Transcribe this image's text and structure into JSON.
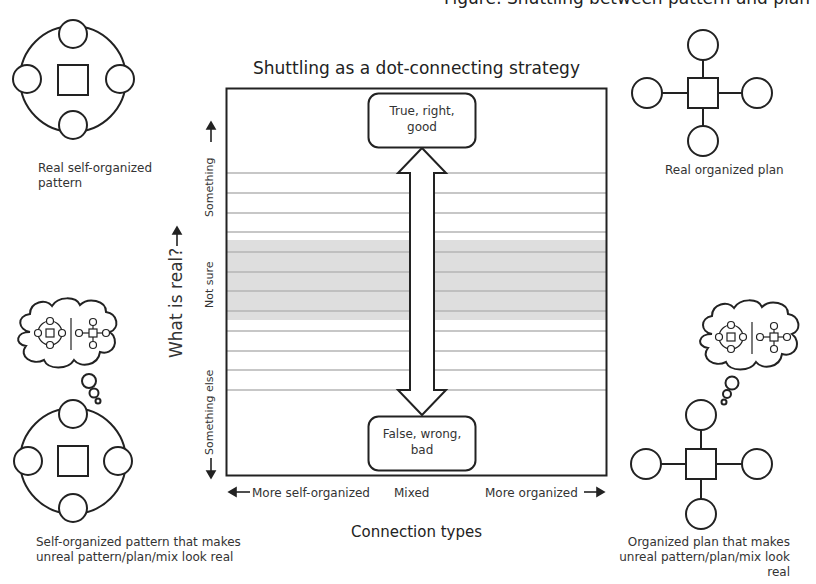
{
  "header": {
    "cropped_top_text": "Figure: Shuttling between pattern and plan"
  },
  "chart": {
    "title": "Shuttling as a dot-connecting strategy",
    "top_box": "True, right, good",
    "top_box_line1": "True, right,",
    "top_box_line2": "good",
    "bottom_box": "False, wrong, bad",
    "bottom_box_line1": "False, wrong,",
    "bottom_box_line2": "bad",
    "y_axis_title": "What is real?",
    "y_axis_arrow": "→",
    "y_bands": {
      "top": "Something",
      "middle": "Not sure",
      "bottom": "Something else"
    },
    "x_axis": {
      "left": "More self-organized",
      "center": "Mixed",
      "right": "More organized",
      "title": "Connection types"
    },
    "arrow": "double-headed vertical arrow between top and bottom boxes"
  },
  "corners": {
    "top_left": {
      "icon": "self-organized-pattern-icon",
      "caption_line1": "Real self-organized",
      "caption_line2": "pattern"
    },
    "top_right": {
      "icon": "organized-plan-icon",
      "caption": "Real organized plan"
    },
    "bottom_left": {
      "icon": "self-organized-pattern-icon",
      "thought": "thought-cloud-icon",
      "caption_line1": "Self-organized pattern that makes",
      "caption_line2": "unreal pattern/plan/mix look real"
    },
    "bottom_right": {
      "icon": "organized-plan-icon",
      "thought": "thought-cloud-icon",
      "caption_line1": "Organized plan that makes",
      "caption_line2": "unreal pattern/plan/mix look real"
    }
  },
  "colors": {
    "stroke": "#222222",
    "stripe": "#b8b8b8",
    "band": "#dcdcdc",
    "text": "#333333"
  }
}
